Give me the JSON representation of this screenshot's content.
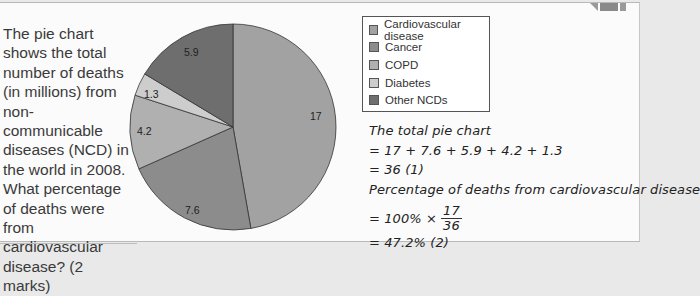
{
  "question": {
    "text": "The pie chart shows the total number of deaths (in millions) from non-communicable diseases (NCD) in the world in 2008. What percentage of deaths were from cardiovascular disease? (2 marks)"
  },
  "chart_data": {
    "type": "pie",
    "title": "",
    "unit": "deaths (millions)",
    "categories": [
      "Cardiovascular disease",
      "Cancer",
      "COPD",
      "Diabetes",
      "Other NCDs"
    ],
    "values": [
      17,
      7.6,
      4.2,
      1.3,
      5.9
    ],
    "colors": [
      "#a2a2a2",
      "#8c8c8c",
      "#b0b0b0",
      "#cdcdcd",
      "#6e6e6e"
    ],
    "start_angle": "12 o'clock",
    "direction": "clockwise",
    "legend_position": "right"
  },
  "labels": {
    "cvd": "17",
    "cancer": "7.6",
    "copd": "4.2",
    "diabetes": "1.3",
    "other": "5.9"
  },
  "legend": {
    "items": [
      {
        "label": "Cardiovascular disease",
        "color": "#a2a2a2"
      },
      {
        "label": "Cancer",
        "color": "#8c8c8c"
      },
      {
        "label": "COPD",
        "color": "#b0b0b0"
      },
      {
        "label": "Diabetes",
        "color": "#cdcdcd"
      },
      {
        "label": "Other NCDs",
        "color": "#6e6e6e"
      }
    ]
  },
  "working": {
    "line1": "The total pie chart",
    "line2": "= 17 + 7.6 + 5.9 + 4.2 + 1.3",
    "line3": "= 36 (1)",
    "line4": "Percentage of deaths from cardiovascular disease",
    "line5_prefix": "= 100% ×",
    "frac_num": "17",
    "frac_den": "36",
    "line6": "= 47.2% (2)"
  }
}
